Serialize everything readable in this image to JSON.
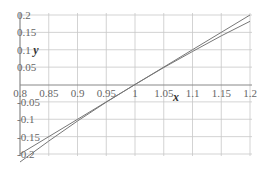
{
  "chart_data": {
    "type": "line",
    "title": "",
    "xlabel": "x",
    "ylabel": "y",
    "xlim": [
      0.8,
      1.2
    ],
    "ylim": [
      -0.2,
      0.2
    ],
    "grid": true,
    "legend": "none",
    "x_ticks": [
      "0.8",
      "0.85",
      "0.9",
      "0.95",
      "1",
      "1.05",
      "1.1",
      "1.15",
      "1.2"
    ],
    "y_ticks": [
      "0.2",
      "0.15",
      "0.1",
      "0.05",
      "-0.05",
      "-0.1",
      "-0.15",
      "-0.2"
    ],
    "series": [
      {
        "name": "y = x - 1",
        "x": [
          0.8,
          0.9,
          1.0,
          1.1,
          1.2
        ],
        "values": [
          -0.2,
          -0.1,
          0.0,
          0.1,
          0.2
        ]
      },
      {
        "name": "y = ln(x)",
        "x": [
          0.8,
          0.85,
          0.9,
          0.95,
          1.0,
          1.05,
          1.1,
          1.15,
          1.2
        ],
        "values": [
          -0.223,
          -0.163,
          -0.105,
          -0.051,
          0.0,
          0.049,
          0.095,
          0.14,
          0.182
        ]
      }
    ],
    "colors": {
      "grid": "#c8c8c8",
      "axis": "#888888",
      "line": "#777777",
      "text": "#666666"
    }
  }
}
